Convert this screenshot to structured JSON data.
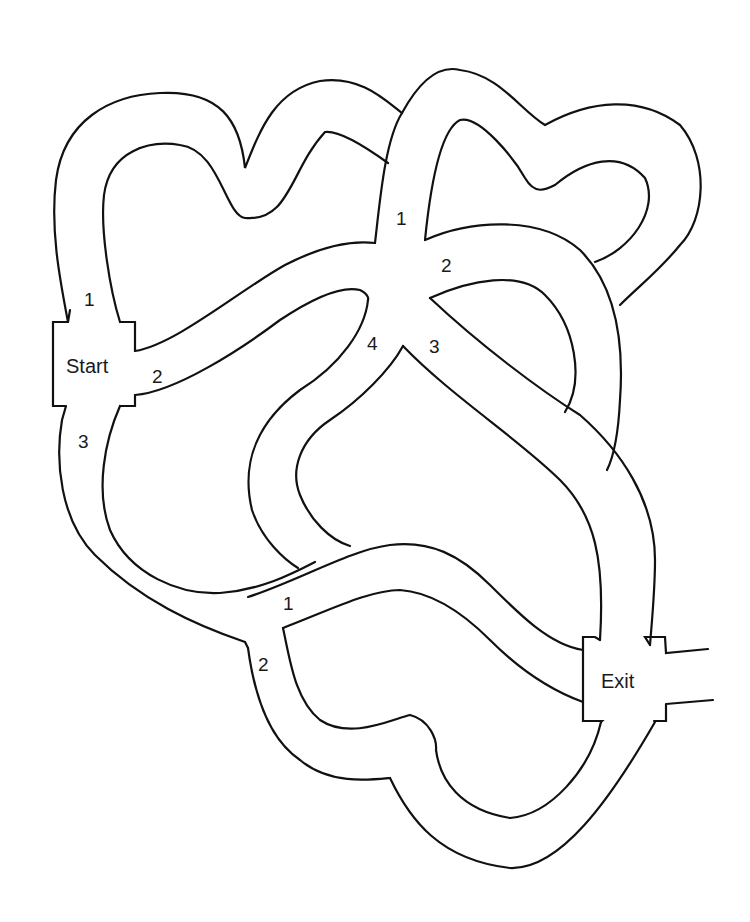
{
  "diagram": {
    "type": "maze",
    "stroke_color": "#111111",
    "background": "#ffffff",
    "start_box": {
      "label": "Start"
    },
    "exit_box": {
      "label": "Exit"
    },
    "junctions": [
      {
        "name": "start",
        "branches": [
          "1",
          "2",
          "3"
        ]
      },
      {
        "name": "center",
        "branches": [
          "1",
          "2",
          "3",
          "4"
        ]
      },
      {
        "name": "lower",
        "branches": [
          "1",
          "2"
        ]
      }
    ],
    "labels": {
      "start": "Start",
      "exit": "Exit",
      "start_1": "1",
      "start_2": "2",
      "start_3": "3",
      "center_1": "1",
      "center_2": "2",
      "center_3": "3",
      "center_4": "4",
      "lower_1": "1",
      "lower_2": "2"
    }
  }
}
